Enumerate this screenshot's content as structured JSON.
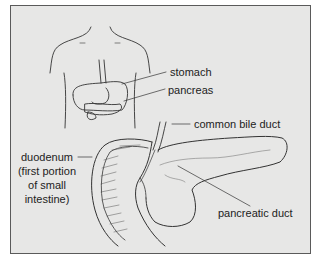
{
  "figure": {
    "labels": {
      "stomach": "stomach",
      "pancreas": "pancreas",
      "common_bile_duct": "common bile duct",
      "duodenum": {
        "line1": "duodenum",
        "line2": "(first portion",
        "line3": "of small",
        "line4": "intestine)"
      },
      "pancreatic_duct": "pancreatic duct"
    }
  },
  "colors": {
    "background": "#e7e7e6",
    "frame_border": "#5a5a5a",
    "ink": "#2a2a2a"
  }
}
